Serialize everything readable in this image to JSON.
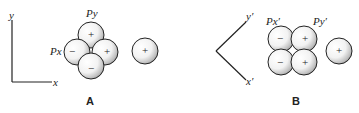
{
  "panels": [
    {
      "id": "A",
      "label": "A",
      "axes": {
        "vertical": "y",
        "horizontal": "x"
      },
      "orbital_labels": {
        "px": "Px",
        "py": "Py"
      },
      "lobes": [
        {
          "position": "top",
          "sign": "+"
        },
        {
          "position": "left",
          "sign": "−"
        },
        {
          "position": "right",
          "sign": "+"
        },
        {
          "position": "bottom",
          "sign": "−"
        }
      ],
      "s_orbital": {
        "sign": "+"
      }
    },
    {
      "id": "B",
      "label": "B",
      "axes": {
        "upper": "y′",
        "lower": "x′"
      },
      "orbital_labels": {
        "px": "Px′",
        "py": "Py′"
      },
      "lobes": [
        {
          "position": "top-left",
          "sign": "−"
        },
        {
          "position": "top-right",
          "sign": "+"
        },
        {
          "position": "bottom-left",
          "sign": "−"
        },
        {
          "position": "bottom-right",
          "sign": "+"
        }
      ],
      "s_orbital": {
        "sign": "+"
      }
    }
  ]
}
